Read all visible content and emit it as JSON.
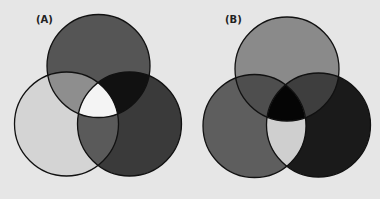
{
  "figure": {
    "background": "#e6e6e6",
    "stroke_color": "#111111",
    "panels": [
      {
        "label": "(A)",
        "label_pos": {
          "x": 36,
          "y": 23
        },
        "circles": [
          {
            "name": "top",
            "cx": 98.5,
            "cy": 66,
            "r": 51.5,
            "fill": "#555555"
          },
          {
            "name": "left",
            "cx": 66.5,
            "cy": 124,
            "r": 52,
            "fill": "#d4d4d4"
          },
          {
            "name": "right",
            "cx": 129.5,
            "cy": 124,
            "r": 52,
            "fill": "#3a3a3a"
          }
        ],
        "regions": {
          "top_left": "#8e8e8e",
          "top_right": "#111111",
          "left_right": "#5a5a5a",
          "center": "#f4f4f4"
        }
      },
      {
        "label": "(B)",
        "label_pos": {
          "x": 225,
          "y": 23
        },
        "circles": [
          {
            "name": "top",
            "cx": 287,
            "cy": 69,
            "r": 52,
            "fill": "#8a8a8a"
          },
          {
            "name": "left",
            "cx": 254.5,
            "cy": 126,
            "r": 51.5,
            "fill": "#5e5e5e"
          },
          {
            "name": "right",
            "cx": 318.5,
            "cy": 125,
            "r": 52,
            "fill": "#1a1a1a"
          }
        ],
        "regions": {
          "top_left": "#4e4e4e",
          "top_right": "#3e3e3e",
          "left_right": "#cfcfcf",
          "center": "#050505"
        }
      }
    ]
  }
}
